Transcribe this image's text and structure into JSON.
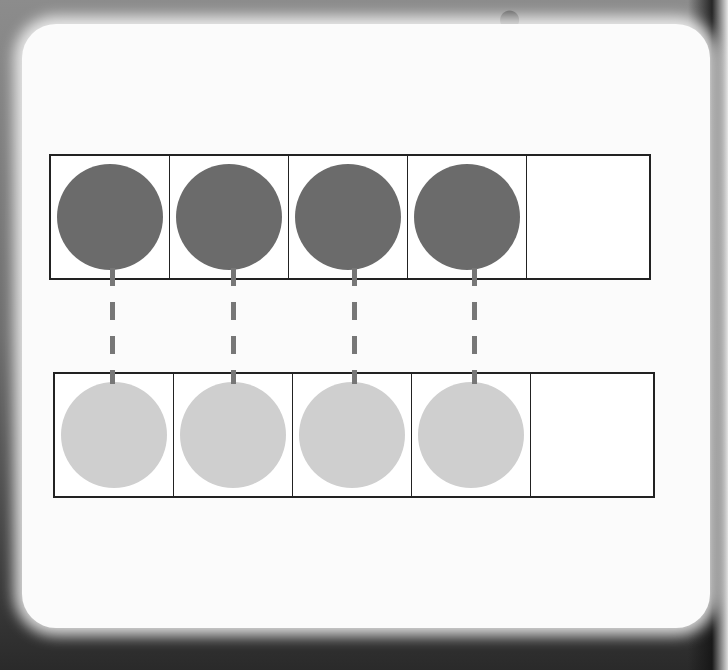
{
  "diagram": {
    "top_frame": {
      "cells": 5,
      "filled": 4,
      "counter_color": "#6b6b6b"
    },
    "bottom_frame": {
      "cells": 5,
      "filled": 4,
      "counter_color": "#cfcfcf"
    },
    "matching_lines": 4,
    "line_color": "#777777",
    "border_color": "#222222"
  }
}
